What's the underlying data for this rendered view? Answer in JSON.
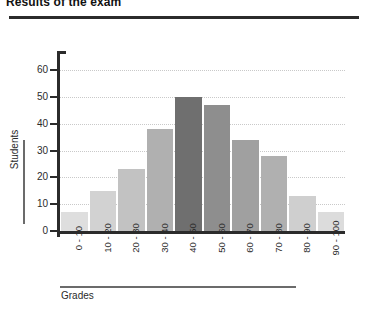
{
  "header": {
    "title": "Results of the exam",
    "rule_color": "#2b2b2b"
  },
  "chart_data": {
    "type": "bar",
    "title": "Results of the exam",
    "xlabel": "Grades",
    "ylabel": "Students",
    "categories": [
      "0 - 10",
      "10 - 20",
      "20 - 30",
      "30 - 40",
      "40 - 50",
      "50 - 60",
      "60 - 70",
      "70 - 80",
      "80 - 90",
      "90 - 100"
    ],
    "values": [
      7,
      15,
      23,
      38,
      50,
      47,
      34,
      28,
      13,
      7
    ],
    "ylim": [
      0,
      65
    ],
    "yticks": [
      0,
      10,
      20,
      30,
      40,
      50,
      60
    ],
    "ytick_labels": [
      "0",
      "10",
      "20",
      "30",
      "40",
      "50",
      "60"
    ],
    "grid": "horizontal-dotted",
    "legend": "none",
    "bar_colors": [
      "#dedede",
      "#d2d2d2",
      "#c2c2c2",
      "#b0b0b0",
      "#6f6f6f",
      "#8e8e8e",
      "#a0a0a0",
      "#b0b0b0",
      "#cfcfcf",
      "#dcdcdc"
    ],
    "grid_color": "#c9c9c9",
    "axis_color": "#2b2b2b"
  }
}
